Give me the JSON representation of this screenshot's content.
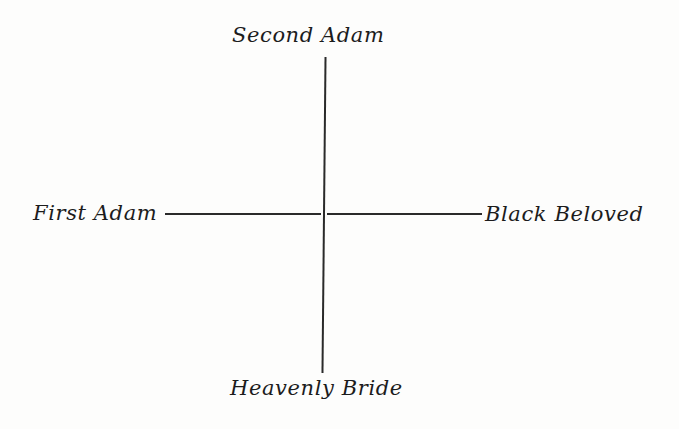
{
  "diagram": {
    "type": "cross-axes",
    "labels": {
      "top": "Second Adam",
      "left": "First Adam",
      "right": "Black Beloved",
      "bottom": "Heavenly Bride"
    },
    "axes": [
      {
        "name": "vertical",
        "from": "Second Adam",
        "to": "Heavenly Bride"
      },
      {
        "name": "horizontal",
        "from": "First Adam",
        "to": "Black Beloved"
      }
    ],
    "colors": {
      "background": "#fdfdfc",
      "ink": "#1c1c1c"
    }
  }
}
